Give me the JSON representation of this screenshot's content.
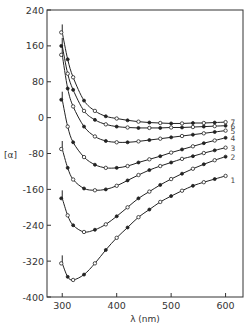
{
  "chart_data": {
    "type": "line",
    "title": "",
    "xlabel": "λ (nm)",
    "ylabel": "[α]",
    "xlim": [
      272,
      632
    ],
    "ylim": [
      -400,
      240
    ],
    "xticks": [
      300,
      400,
      500,
      600
    ],
    "yticks": [
      240,
      160,
      80,
      0,
      -80,
      -160,
      -240,
      -320,
      -400
    ],
    "ytick_labels": [
      "240",
      "160",
      "80",
      "0",
      "-80",
      "-160",
      "-240",
      "-320",
      "-400"
    ],
    "grid": false,
    "legend": "curve numbers labeled at right end of each curve",
    "x": [
      300,
      310,
      320,
      340,
      360,
      380,
      400,
      420,
      440,
      460,
      480,
      500,
      520,
      540,
      560,
      580,
      600
    ],
    "series": [
      {
        "name": "1",
        "values": [
          -325,
          -355,
          -362,
          -350,
          -325,
          -295,
          -268,
          -245,
          -222,
          -205,
          -188,
          -175,
          -163,
          -152,
          -144,
          -137,
          -130
        ]
      },
      {
        "name": "2",
        "values": [
          -180,
          -218,
          -240,
          -255,
          -250,
          -238,
          -220,
          -200,
          -180,
          -165,
          -150,
          -137,
          -125,
          -114,
          -104,
          -95,
          -87
        ]
      },
      {
        "name": "3",
        "values": [
          -70,
          -112,
          -138,
          -158,
          -162,
          -160,
          -152,
          -140,
          -128,
          -117,
          -108,
          -100,
          -92,
          -86,
          -79,
          -73,
          -67
        ]
      },
      {
        "name": "4",
        "values": [
          40,
          -20,
          -55,
          -88,
          -105,
          -112,
          -112,
          -108,
          -100,
          -93,
          -86,
          -78,
          -71,
          -64,
          -57,
          -51,
          -45
        ]
      },
      {
        "name": "5",
        "values": [
          140,
          65,
          25,
          -20,
          -42,
          -52,
          -55,
          -55,
          -53,
          -50,
          -47,
          -44,
          -41,
          -38,
          -35,
          -32,
          -29
        ]
      },
      {
        "name": "6",
        "values": [
          160,
          98,
          62,
          15,
          -5,
          -15,
          -20,
          -22,
          -23,
          -23,
          -23,
          -22,
          -22,
          -21,
          -20,
          -19,
          -18
        ]
      },
      {
        "name": "7",
        "values": [
          190,
          130,
          90,
          38,
          15,
          3,
          -2,
          -6,
          -9,
          -11,
          -12,
          -13,
          -13,
          -12,
          -12,
          -11,
          -10
        ]
      }
    ]
  },
  "axes": {
    "x_title": "λ (nm)",
    "y_title": "[α]"
  }
}
